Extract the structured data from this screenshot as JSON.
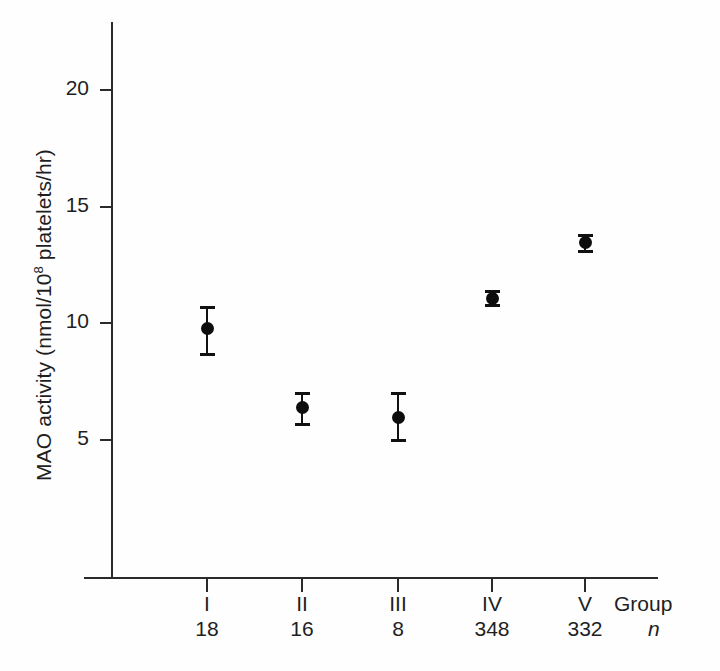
{
  "chart_data": {
    "type": "scatter",
    "title": "",
    "xlabel": "Group",
    "ylabel": "MAO activity (nmol/10⁸ platelets/hr)",
    "ylabel_prefix": "MAO activity (nmol/10",
    "ylabel_exponent": "8",
    "ylabel_suffix": " platelets/hr)",
    "grid": false,
    "legend": "none",
    "error_bars": "mean ± SEM",
    "ylim": [
      0,
      23
    ],
    "yticks": [
      5,
      10,
      15,
      20
    ],
    "ytick_labels": [
      "5",
      "10",
      "15",
      "20"
    ],
    "categories": [
      "I",
      "II",
      "III",
      "IV",
      "V"
    ],
    "n_label": "n",
    "n_values": [
      18,
      16,
      8,
      348,
      332
    ],
    "values": [
      9.8,
      6.4,
      6.0,
      11.1,
      13.5
    ],
    "err_low": [
      8.7,
      5.7,
      5.0,
      10.8,
      13.1
    ],
    "err_high": [
      10.7,
      7.0,
      7.0,
      11.4,
      13.8
    ],
    "points": [
      {
        "category": "I",
        "n": "18",
        "value": 9.8,
        "low": 8.7,
        "high": 10.7
      },
      {
        "category": "II",
        "n": "16",
        "value": 6.4,
        "low": 5.7,
        "high": 7.0
      },
      {
        "category": "III",
        "n": "8",
        "value": 6.0,
        "low": 5.0,
        "high": 7.0
      },
      {
        "category": "IV",
        "n": "348",
        "value": 11.1,
        "low": 10.8,
        "high": 11.4
      },
      {
        "category": "V",
        "n": "332",
        "value": 13.5,
        "low": 13.1,
        "high": 13.8
      }
    ],
    "marker_color": "#0d0d0d",
    "axis_color": "#2a2a2a",
    "background_color": "#fefefe"
  }
}
